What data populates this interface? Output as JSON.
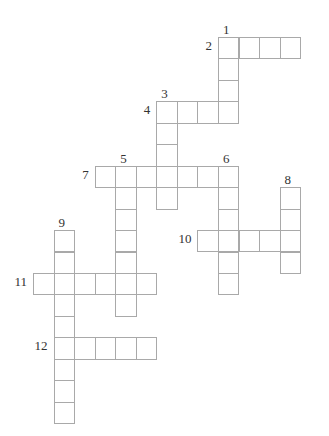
{
  "grid": {
    "origin_x": 33,
    "origin_y": 37,
    "cell_w": 20.55,
    "cell_h": 21.45,
    "border_color": "#a9a9a9",
    "label_color": "#333333"
  },
  "words": [
    {
      "number": "1",
      "direction": "down",
      "row": 0,
      "col": 9,
      "length": 4
    },
    {
      "number": "2",
      "direction": "across",
      "row": 0,
      "col": 9,
      "length": 4
    },
    {
      "number": "3",
      "direction": "down",
      "row": 3,
      "col": 6,
      "length": 5
    },
    {
      "number": "4",
      "direction": "across",
      "row": 3,
      "col": 6,
      "length": 4
    },
    {
      "number": "5",
      "direction": "down",
      "row": 6,
      "col": 4,
      "length": 7
    },
    {
      "number": "6",
      "direction": "down",
      "row": 6,
      "col": 9,
      "length": 6
    },
    {
      "number": "7",
      "direction": "across",
      "row": 6,
      "col": 3,
      "length": 7
    },
    {
      "number": "8",
      "direction": "down",
      "row": 7,
      "col": 12,
      "length": 4
    },
    {
      "number": "9",
      "direction": "down",
      "row": 9,
      "col": 1,
      "length": 9
    },
    {
      "number": "10",
      "direction": "across",
      "row": 9,
      "col": 8,
      "length": 5
    },
    {
      "number": "11",
      "direction": "across",
      "row": 11,
      "col": 0,
      "length": 6
    },
    {
      "number": "12",
      "direction": "across",
      "row": 14,
      "col": 1,
      "length": 5
    }
  ]
}
